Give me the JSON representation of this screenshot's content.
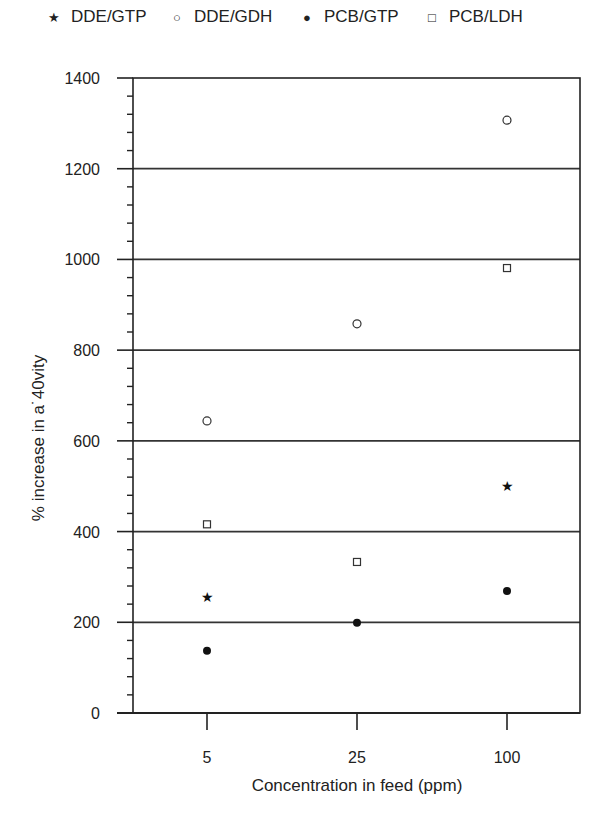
{
  "legend": [
    {
      "label": "DDE/GTP",
      "marker": "star",
      "symbol": "★"
    },
    {
      "label": "DDE/GDH",
      "marker": "open-circle",
      "symbol": "○"
    },
    {
      "label": "PCB/GTP",
      "marker": "filled-circle",
      "symbol": "●"
    },
    {
      "label": "PCB/LDH",
      "marker": "open-square",
      "symbol": "□"
    }
  ],
  "axes": {
    "xlabel": "Concentration in feed (ppm)",
    "ylabel": "% increase in a˙40vity",
    "xticks": [
      "5",
      "25",
      "100"
    ],
    "yticks": [
      "0",
      "200",
      "400",
      "600",
      "800",
      "1000",
      "1200",
      "1400"
    ]
  },
  "chart_data": {
    "type": "scatter",
    "title": "",
    "xlabel": "Concentration in feed (ppm)",
    "ylabel": "% increase in activity",
    "categories": [
      "5",
      "25",
      "100"
    ],
    "ylim": [
      0,
      1400
    ],
    "grid": "horizontal at 200, 400, 600, 800, 1000, 1200",
    "legend_position": "top",
    "series": [
      {
        "name": "DDE/GTP",
        "marker": "star",
        "values": [
          256,
          null,
          500
        ]
      },
      {
        "name": "DDE/GDH",
        "marker": "open-circle",
        "values": [
          644,
          858,
          1307
        ]
      },
      {
        "name": "PCB/GTP",
        "marker": "filled-circle",
        "values": [
          137,
          199,
          269
        ]
      },
      {
        "name": "PCB/LDH",
        "marker": "open-square",
        "values": [
          416,
          333,
          981
        ]
      }
    ]
  }
}
